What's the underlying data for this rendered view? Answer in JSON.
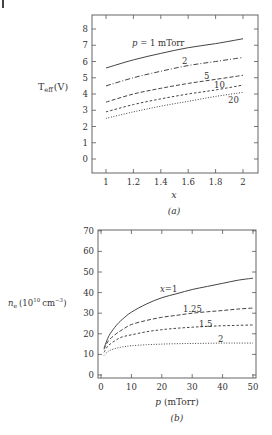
{
  "chart_data": [
    {
      "type": "line",
      "panel_label": "(a)",
      "title": "",
      "xlabel": "x",
      "ylabel": "T_eff (V)",
      "ylabel_main": "T",
      "ylabel_sub": "eff",
      "ylabel_unit": "(V)",
      "xlim": [
        0.9,
        2.1
      ],
      "ylim": [
        -0.8,
        8.6
      ],
      "xticks": [
        1,
        1.2,
        1.4,
        1.6,
        1.8,
        2
      ],
      "xtick_labels": [
        "1",
        "1.2",
        "1.4",
        "1.6",
        "1.8",
        "2"
      ],
      "yticks": [
        0,
        1,
        2,
        3,
        4,
        5,
        6,
        7,
        8
      ],
      "ytick_labels": [
        "0",
        "1",
        "2",
        "3",
        "4",
        "5",
        "6",
        "7",
        "8"
      ],
      "grid": false,
      "x": [
        1,
        1.2,
        1.4,
        1.6,
        1.8,
        2
      ],
      "series": [
        {
          "name": "p = 1 mTorr",
          "label": "p = 1 mTorr",
          "style": "solid",
          "values": [
            5.6,
            6.1,
            6.5,
            6.85,
            7.1,
            7.4
          ]
        },
        {
          "name": "2",
          "label": "2",
          "style": "dashdot",
          "values": [
            4.5,
            5.0,
            5.4,
            5.75,
            6.0,
            6.25
          ]
        },
        {
          "name": "5",
          "label": "5",
          "style": "dashed",
          "values": [
            3.5,
            4.0,
            4.35,
            4.65,
            4.9,
            5.15
          ]
        },
        {
          "name": "10",
          "label": "10",
          "style": "shortdash",
          "values": [
            2.9,
            3.35,
            3.7,
            4.0,
            4.25,
            4.55
          ]
        },
        {
          "name": "20",
          "label": "20",
          "style": "dotted",
          "values": [
            2.5,
            2.9,
            3.25,
            3.55,
            3.85,
            4.1
          ]
        }
      ]
    },
    {
      "type": "line",
      "panel_label": "(b)",
      "title": "",
      "xlabel": "p (mTorr)",
      "xlabel_var": "p",
      "xlabel_unit": "(mTorr)",
      "ylabel": "n_e (10^10 cm^-3)",
      "ylabel_var": "n",
      "ylabel_sub": "e",
      "ylabel_base": "(10",
      "ylabel_exp": "10",
      "ylabel_unit": "cm",
      "ylabel_unit_exp": "−3",
      "ylabel_close": ")",
      "xlim": [
        -1,
        51
      ],
      "ylim": [
        -1,
        70
      ],
      "xticks": [
        0,
        10,
        20,
        30,
        40,
        50
      ],
      "xtick_labels": [
        "0",
        "10",
        "20",
        "30",
        "40",
        "50"
      ],
      "yticks": [
        0,
        10,
        20,
        30,
        40,
        50,
        60,
        70
      ],
      "ytick_labels": [
        "0",
        "10",
        "20",
        "30",
        "40",
        "50",
        "60",
        "70"
      ],
      "grid": false,
      "x": [
        1,
        2,
        3,
        5,
        7,
        10,
        15,
        20,
        25,
        30,
        35,
        40,
        45,
        50
      ],
      "series": [
        {
          "name": "x=1",
          "label": "x=1",
          "style": "solid",
          "values": [
            13,
            17,
            20,
            24,
            27,
            30.5,
            34.5,
            37.5,
            39.5,
            41.5,
            43,
            44.5,
            46,
            47
          ]
        },
        {
          "name": "1.25",
          "label": "1.25",
          "style": "dashed",
          "values": [
            12.5,
            15.5,
            17.5,
            20,
            22,
            24.5,
            26.5,
            28,
            29,
            30,
            30.7,
            31.3,
            32,
            32.5
          ]
        },
        {
          "name": "1.5",
          "label": "1.5",
          "style": "shortdash",
          "values": [
            11,
            13.5,
            15,
            17,
            18.5,
            19.5,
            21,
            22,
            22.7,
            23.2,
            23.6,
            23.9,
            24.1,
            24.3
          ]
        },
        {
          "name": "2",
          "label": "2",
          "style": "dotted",
          "values": [
            9.5,
            11,
            12,
            13,
            13.6,
            14.2,
            14.7,
            15,
            15.2,
            15.3,
            15.4,
            15.5,
            15.5,
            15.5
          ]
        }
      ]
    }
  ]
}
